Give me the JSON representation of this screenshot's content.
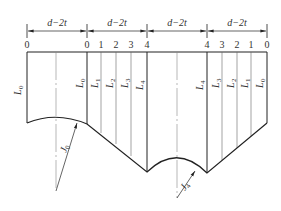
{
  "diagram": {
    "type": "pipe-development-layout",
    "dimension_label": "d−2t",
    "dimension_segments": [
      "d−2t",
      "d−2t",
      "d−2t",
      "d−2t"
    ],
    "top_numbers": [
      "0",
      "0",
      "1",
      "2",
      "3",
      "4",
      "4",
      "3",
      "2",
      "1",
      "0"
    ],
    "line_labels": {
      "left_l0": "L",
      "left_l0_sub": "0",
      "seg2": [
        {
          "main": "L",
          "sub": "0"
        },
        {
          "main": "L",
          "sub": "1"
        },
        {
          "main": "L",
          "sub": "2"
        },
        {
          "main": "L",
          "sub": "3"
        },
        {
          "main": "L",
          "sub": "4"
        }
      ],
      "seg4": [
        {
          "main": "L",
          "sub": "4"
        },
        {
          "main": "L",
          "sub": "3"
        },
        {
          "main": "L",
          "sub": "2"
        },
        {
          "main": "L",
          "sub": "1"
        },
        {
          "main": "L",
          "sub": "0"
        }
      ]
    },
    "radius_labels": [
      {
        "main": "J",
        "sub": "0"
      },
      {
        "main": "J",
        "sub": "4"
      }
    ],
    "colors": {
      "outline": "#222222",
      "thin_line": "#777777",
      "text": "#333333"
    }
  }
}
